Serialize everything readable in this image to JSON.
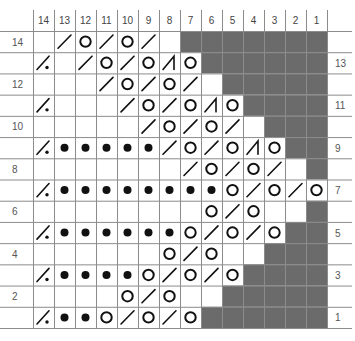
{
  "chart": {
    "column_numbers": [
      "14",
      "13",
      "12",
      "11",
      "10",
      "9",
      "8",
      "7",
      "6",
      "5",
      "4",
      "3",
      "2",
      "1"
    ],
    "left_row_labels": {
      "14": "14",
      "12": "12",
      "10": "10",
      "8": "8",
      "6": "6",
      "4": "4",
      "2": "2"
    },
    "right_row_labels": {
      "13": "13",
      "11": "11",
      "9": "9",
      "7": "7",
      "5": "5",
      "3": "3",
      "1": "1"
    },
    "legend_symbols": {
      "": "empty",
      "/": "k2tog",
      "O": "yarn-over",
      "P": "purl-dot",
      "/.": "slash-with-dot",
      "/|": "slash-with-bar",
      "X": "no-stitch"
    },
    "colors": {
      "no_stitch": "#6b6b6b",
      "grid": "#8c8c8c",
      "symbol": "#111111",
      "label": "#555555"
    },
    "rows": [
      {
        "row": "14",
        "cells": [
          "",
          "/",
          "O",
          "/",
          "O",
          "/",
          "",
          "X",
          "X",
          "X",
          "X",
          "X",
          "X",
          "X"
        ]
      },
      {
        "row": "13",
        "cells": [
          "/.",
          "",
          "/",
          "O",
          "/",
          "O",
          "/|",
          "O",
          "X",
          "X",
          "X",
          "X",
          "X",
          "X"
        ]
      },
      {
        "row": "12",
        "cells": [
          "",
          "",
          "",
          "/",
          "O",
          "/",
          "O",
          "/",
          "",
          "X",
          "X",
          "X",
          "X",
          "X"
        ]
      },
      {
        "row": "11",
        "cells": [
          "/.",
          "",
          "",
          "",
          "/",
          "O",
          "/",
          "O",
          "/|",
          "O",
          "X",
          "X",
          "X",
          "X"
        ]
      },
      {
        "row": "10",
        "cells": [
          "",
          "",
          "",
          "",
          "",
          "/",
          "O",
          "/",
          "O",
          "/",
          "",
          "X",
          "X",
          "X"
        ]
      },
      {
        "row": "9",
        "cells": [
          "/.",
          "P",
          "P",
          "P",
          "P",
          "P",
          "/",
          "O",
          "/",
          "O",
          "/|",
          "O",
          "X",
          "X"
        ]
      },
      {
        "row": "8",
        "cells": [
          "",
          "",
          "",
          "",
          "",
          "",
          "",
          "/",
          "O",
          "/",
          "O",
          "/",
          "",
          "X"
        ]
      },
      {
        "row": "7",
        "cells": [
          "/.",
          "P",
          "P",
          "P",
          "P",
          "P",
          "P",
          "P",
          "P",
          "O",
          "/",
          "O",
          "/",
          "O"
        ]
      },
      {
        "row": "6",
        "cells": [
          "",
          "",
          "",
          "",
          "",
          "",
          "",
          "",
          "O",
          "/",
          "O",
          "",
          "",
          "X"
        ]
      },
      {
        "row": "5",
        "cells": [
          "/.",
          "P",
          "P",
          "P",
          "P",
          "P",
          "P",
          "O",
          "/",
          "O",
          "/",
          "O",
          "X",
          "X"
        ]
      },
      {
        "row": "4",
        "cells": [
          "",
          "",
          "",
          "",
          "",
          "",
          "O",
          "/",
          "O",
          "",
          "",
          "X",
          "X",
          "X"
        ]
      },
      {
        "row": "3",
        "cells": [
          "/.",
          "P",
          "P",
          "P",
          "P",
          "O",
          "/",
          "O",
          "/",
          "O",
          "X",
          "X",
          "X",
          "X"
        ]
      },
      {
        "row": "2",
        "cells": [
          "",
          "",
          "",
          "",
          "O",
          "/",
          "O",
          "",
          "",
          "X",
          "X",
          "X",
          "X",
          "X"
        ]
      },
      {
        "row": "1",
        "cells": [
          "/.",
          "P",
          "P",
          "O",
          "/",
          "O",
          "/",
          "O",
          "X",
          "X",
          "X",
          "X",
          "X",
          "X"
        ]
      }
    ]
  }
}
